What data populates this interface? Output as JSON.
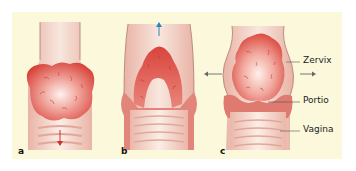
{
  "figure": {
    "background": "#fbf8dc",
    "tissue_color": "#e9a79c",
    "tumor_color": "#d9413a",
    "arrow_blue": "#2a86b8",
    "arrow_red": "#d0302a",
    "arrow_gray": "#666666"
  },
  "panels": [
    {
      "letter": "a",
      "description": "Tumor growing exophytically downward into vagina",
      "arrow": "down-red"
    },
    {
      "letter": "b",
      "description": "Tumor growing endocervically upward",
      "arrow": "up-blue"
    },
    {
      "letter": "c",
      "description": "Tumor expanding cervix barrel-shaped",
      "arrow": "left-right-gray"
    }
  ],
  "labels": {
    "zervix": "Zervix",
    "portio": "Portio",
    "vagina": "Vagina"
  }
}
